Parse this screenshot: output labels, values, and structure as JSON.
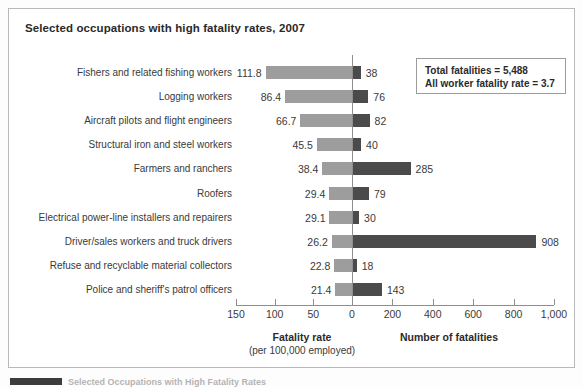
{
  "panel": {
    "title": "Selected occupations with high fatality rates, 2007"
  },
  "info_box": {
    "line1": "Total fatalities = 5,488",
    "line2": "All worker fatality rate = 3.7"
  },
  "axes": {
    "left_title": "Fatality rate",
    "left_subtitle": "(per 100,000 employed)",
    "right_title": "Number of fatalities",
    "left_ticks": [
      "150",
      "100",
      "50",
      "0"
    ],
    "right_ticks": [
      "200",
      "400",
      "600",
      "800",
      "1,000"
    ]
  },
  "bottom_caption": {
    "text": "Selected Occupations with High Fatality Rates"
  },
  "colors": {
    "rate_bar": "#9d9d9d",
    "count_bar": "#4b4b4b",
    "axis": "#8e8e8e",
    "border": "#b9b9b9",
    "text": "#3a3a3a"
  },
  "chart_data": {
    "type": "bar",
    "title": "Selected occupations with high fatality rates, 2007",
    "subtype": "bidirectional-paired-bar",
    "categories": [
      "Fishers and related fishing workers",
      "Logging workers",
      "Aircraft pilots and flight engineers",
      "Structural iron and steel workers",
      "Farmers and ranchers",
      "Roofers",
      "Electrical power-line installers and repairers",
      "Driver/sales workers and truck drivers",
      "Refuse and recyclable material collectors",
      "Police and sheriff's patrol officers"
    ],
    "series": [
      {
        "name": "Fatality rate",
        "unit": "per 100,000 employed",
        "direction": "left",
        "color": "#9d9d9d",
        "values": [
          111.8,
          86.4,
          66.7,
          45.5,
          38.4,
          29.4,
          29.1,
          26.2,
          22.8,
          21.4
        ],
        "labels": [
          "111.8",
          "86.4",
          "66.7",
          "45.5",
          "38.4",
          "29.4",
          "29.1",
          "26.2",
          "22.8",
          "21.4"
        ],
        "axis_range": [
          0,
          150
        ],
        "axis_ticks": [
          150,
          100,
          50,
          0
        ]
      },
      {
        "name": "Number of fatalities",
        "unit": "count",
        "direction": "right",
        "color": "#4b4b4b",
        "values": [
          38,
          76,
          82,
          40,
          285,
          79,
          30,
          908,
          18,
          143
        ],
        "labels": [
          "38",
          "76",
          "82",
          "40",
          "285",
          "79",
          "30",
          "908",
          "18",
          "143"
        ],
        "axis_range": [
          0,
          1000
        ],
        "axis_ticks": [
          0,
          200,
          400,
          600,
          800,
          1000
        ]
      }
    ],
    "xlabel": "",
    "ylabel": "",
    "grid": false,
    "legend": false,
    "annotations": [
      "Total fatalities = 5,488",
      "All worker fatality rate = 3.7"
    ]
  }
}
